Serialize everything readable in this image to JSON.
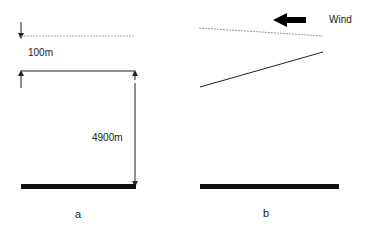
{
  "panel_a": {
    "label": "a",
    "gap_label": "100m",
    "height_label": "4900m"
  },
  "panel_b": {
    "label": "b",
    "wind_label": "Wind"
  },
  "colors": {
    "line": "#222222",
    "dashed": "#999999",
    "ground": "#111111"
  }
}
